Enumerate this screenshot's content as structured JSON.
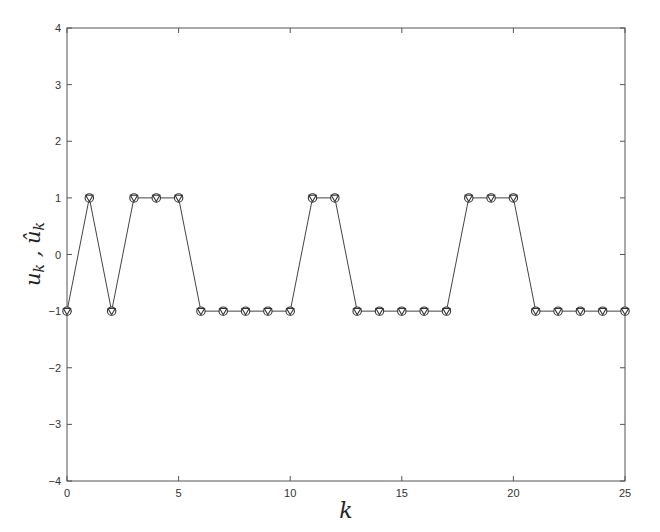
{
  "chart_data": {
    "type": "line",
    "title": "",
    "xlabel": "k",
    "ylabel": "u_k , û_k",
    "xlim": [
      0,
      25
    ],
    "ylim": [
      -4,
      4
    ],
    "grid": false,
    "legend": null,
    "x_ticks": [
      0,
      5,
      10,
      15,
      20,
      25
    ],
    "y_ticks": [
      -4,
      -3,
      -2,
      -1,
      0,
      1,
      2,
      3,
      4
    ],
    "x": [
      0,
      1,
      2,
      3,
      4,
      5,
      6,
      7,
      8,
      9,
      10,
      11,
      12,
      13,
      14,
      15,
      16,
      17,
      18,
      19,
      20,
      21,
      22,
      23,
      24,
      25
    ],
    "series": [
      {
        "name": "u_k",
        "marker": "circle",
        "line": "solid",
        "values": [
          -1,
          1,
          -1,
          1,
          1,
          1,
          -1,
          -1,
          -1,
          -1,
          -1,
          1,
          1,
          -1,
          -1,
          -1,
          -1,
          -1,
          1,
          1,
          1,
          -1,
          -1,
          -1,
          -1,
          -1
        ]
      },
      {
        "name": "û_k",
        "marker": "triangle-down",
        "line": "none",
        "values": [
          -1,
          1,
          -1,
          1,
          1,
          1,
          -1,
          -1,
          -1,
          -1,
          -1,
          1,
          1,
          -1,
          -1,
          -1,
          -1,
          -1,
          1,
          1,
          1,
          -1,
          -1,
          -1,
          -1,
          -1
        ]
      }
    ]
  },
  "colors": {
    "axis": "#555555",
    "line": "#444444",
    "marker": "#333333"
  }
}
